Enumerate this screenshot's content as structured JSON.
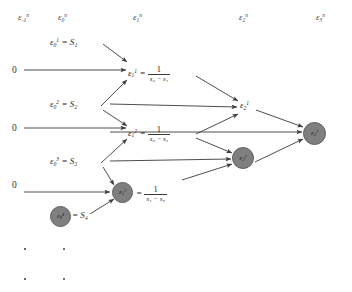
{
  "figure": {
    "type": "epsilon-algorithm-lozenge-diagram",
    "headers": [
      {
        "id": "col-neg1",
        "text": "εⁿ₋₁",
        "base": "ε",
        "sub": "-1",
        "sup": "n",
        "x": 18,
        "y": 13
      },
      {
        "id": "col-0",
        "text": "εⁿ₀",
        "base": "ε",
        "sub": "0",
        "sup": "n",
        "x": 58,
        "y": 13
      },
      {
        "id": "col-1",
        "text": "εⁿ₁",
        "base": "ε",
        "sub": "1",
        "sup": "n",
        "x": 133,
        "y": 13
      },
      {
        "id": "col-2",
        "text": "εⁿ₂",
        "base": "ε",
        "sub": "2",
        "sup": "n",
        "x": 239,
        "y": 13
      },
      {
        "id": "col-3",
        "text": "εⁿ₃",
        "base": "ε",
        "sub": "3",
        "sup": "n",
        "x": 316,
        "y": 13
      }
    ],
    "zeros": [
      {
        "id": "zero-1",
        "label": "0",
        "x": 12,
        "y": 66
      },
      {
        "id": "zero-2",
        "label": "0",
        "x": 12,
        "y": 124
      },
      {
        "id": "zero-3",
        "label": "0",
        "x": 12,
        "y": 181
      }
    ],
    "seeds": [
      {
        "id": "seed-1",
        "base": "ε",
        "sub": "0",
        "sup": "1",
        "eq": "=",
        "value": "S₁",
        "x": 50,
        "y": 38,
        "circled": false
      },
      {
        "id": "seed-2",
        "base": "ε",
        "sub": "0",
        "sup": "2",
        "eq": "=",
        "value": "S₂",
        "x": 50,
        "y": 100,
        "circled": false
      },
      {
        "id": "seed-3",
        "base": "ε",
        "sub": "0",
        "sup": "3",
        "eq": "=",
        "value": "S₃",
        "x": 50,
        "y": 157,
        "circled": false
      },
      {
        "id": "seed-4",
        "base": "ε",
        "sub": "0",
        "sup": "4",
        "eq": "=",
        "value": "S₄",
        "x": 50,
        "y": 213,
        "circled": true
      }
    ],
    "col1_nodes": [
      {
        "id": "eps-1-1",
        "base": "ε",
        "sub": "1",
        "sup": "1",
        "eq": "=",
        "num": "1",
        "den": "s₂ − s₁",
        "x": 126,
        "y": 67,
        "circled": false
      },
      {
        "id": "eps-1-2",
        "base": "ε",
        "sub": "1",
        "sup": "2",
        "eq": "=",
        "num": "1",
        "den": "s₃ − s₂",
        "x": 126,
        "y": 127,
        "circled": false
      },
      {
        "id": "eps-1-3",
        "base": "ε",
        "sub": "1",
        "sup": "3",
        "eq": "=",
        "num": "1",
        "den": "s₄ − s₃",
        "x": 126,
        "y": 186,
        "circled": true
      }
    ],
    "col2_nodes": [
      {
        "id": "eps-2-1",
        "base": "ε",
        "sub": "2",
        "sup": "1",
        "x": 240,
        "y": 104,
        "circled": false
      },
      {
        "id": "eps-2-2",
        "base": "ε",
        "sub": "2",
        "sup": "2",
        "x": 240,
        "y": 156,
        "circled": true
      }
    ],
    "col3_nodes": [
      {
        "id": "eps-3-1",
        "base": "ε",
        "sub": "3",
        "sup": "1",
        "x": 310,
        "y": 130,
        "circled": true
      }
    ],
    "ellipsis": [
      {
        "id": "dots-col-neg1",
        "x": 24,
        "y": 248
      },
      {
        "id": "dots-col-neg1-b",
        "x": 24,
        "y": 278
      },
      {
        "id": "dots-col-0",
        "x": 63,
        "y": 248
      },
      {
        "id": "dots-col-0-b",
        "x": 63,
        "y": 278
      }
    ],
    "colors": {
      "node_fill": "#7f7f7f",
      "node_stroke": "#5e5e5e",
      "arrow": "#3a3a3a",
      "text": "#2b2b2b"
    }
  }
}
